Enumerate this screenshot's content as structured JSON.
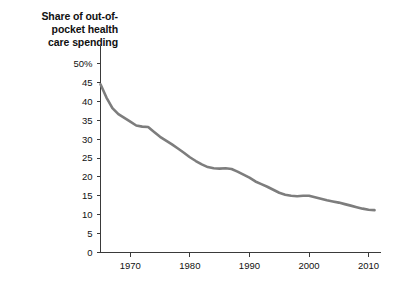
{
  "chart_data": {
    "type": "line",
    "title": "Share of out-of-\npocket health\ncare spending",
    "title_lines": [
      "Share of out-of-",
      "pocket health",
      "care spending"
    ],
    "xlabel": "",
    "ylabel": "",
    "xlim": [
      1965,
      2012
    ],
    "ylim": [
      0,
      50
    ],
    "grid": false,
    "legend": null,
    "line_color": "#7d7d7d",
    "axis_color": "#3a3a3a",
    "text_color": "#111111",
    "background_color": "#ffffff",
    "y_ticks": [
      0,
      5,
      10,
      15,
      20,
      25,
      30,
      35,
      40,
      45,
      50
    ],
    "y_tick_labels": [
      "0",
      "5",
      "10",
      "15",
      "20",
      "25",
      "30",
      "35",
      "40",
      "45",
      "50%"
    ],
    "x_ticks": [
      1970,
      1980,
      1990,
      2000,
      2010
    ],
    "x_tick_labels": [
      "1970",
      "1980",
      "1990",
      "2000",
      "2010"
    ],
    "series": [
      {
        "name": "Share of out-of-pocket health care spending",
        "x": [
          1965,
          1966,
          1967,
          1968,
          1969,
          1970,
          1971,
          1972,
          1973,
          1974,
          1975,
          1976,
          1977,
          1978,
          1979,
          1980,
          1981,
          1982,
          1983,
          1984,
          1985,
          1986,
          1987,
          1988,
          1989,
          1990,
          1991,
          1992,
          1993,
          1994,
          1995,
          1996,
          1997,
          1998,
          1999,
          2000,
          2001,
          2002,
          2003,
          2004,
          2005,
          2006,
          2007,
          2008,
          2009,
          2010,
          2011
        ],
        "values": [
          44.5,
          41.0,
          38.2,
          36.6,
          35.6,
          34.6,
          33.6,
          33.3,
          33.2,
          31.9,
          30.6,
          29.6,
          28.6,
          27.5,
          26.4,
          25.2,
          24.2,
          23.3,
          22.6,
          22.3,
          22.2,
          22.3,
          22.1,
          21.4,
          20.6,
          19.8,
          18.8,
          18.1,
          17.4,
          16.6,
          15.8,
          15.3,
          15.0,
          14.9,
          15.0,
          15.0,
          14.6,
          14.2,
          13.8,
          13.5,
          13.2,
          12.8,
          12.4,
          12.0,
          11.6,
          11.3,
          11.2
        ]
      }
    ]
  }
}
